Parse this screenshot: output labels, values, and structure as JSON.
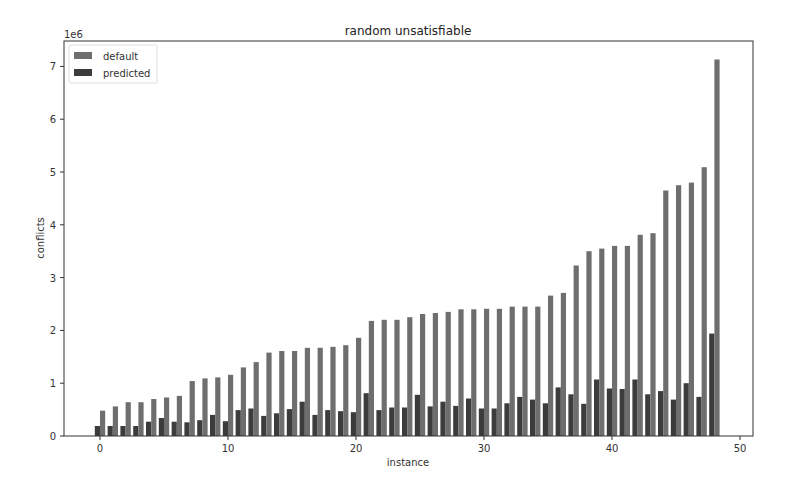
{
  "chart_data": {
    "type": "bar",
    "title": "random unsatisfiable",
    "xlabel": "instance",
    "ylabel": "conflicts",
    "y_offset_label": "1e6",
    "xlim": [
      -2,
      51
    ],
    "ylim": [
      0,
      7.5
    ],
    "xticks": [
      0,
      10,
      20,
      30,
      40,
      50
    ],
    "yticks": [
      0,
      1,
      2,
      3,
      4,
      5,
      6,
      7
    ],
    "grid": false,
    "legend_position": "upper left",
    "categories": [
      0,
      1,
      2,
      3,
      4,
      5,
      6,
      7,
      8,
      9,
      10,
      11,
      12,
      13,
      14,
      15,
      16,
      17,
      18,
      19,
      20,
      21,
      22,
      23,
      24,
      25,
      26,
      27,
      28,
      29,
      30,
      31,
      32,
      33,
      34,
      35,
      36,
      37,
      38,
      39,
      40,
      41,
      42,
      43,
      44,
      45,
      46,
      47,
      48
    ],
    "series": [
      {
        "name": "default",
        "color": "#6e6e6e",
        "values": [
          0.48,
          0.56,
          0.64,
          0.64,
          0.7,
          0.73,
          0.76,
          1.04,
          1.09,
          1.11,
          1.16,
          1.3,
          1.4,
          1.58,
          1.61,
          1.61,
          1.67,
          1.67,
          1.69,
          1.72,
          1.86,
          2.18,
          2.2,
          2.2,
          2.25,
          2.31,
          2.33,
          2.35,
          2.4,
          2.4,
          2.41,
          2.41,
          2.45,
          2.45,
          2.45,
          2.66,
          2.71,
          3.23,
          3.5,
          3.55,
          3.6,
          3.6,
          3.81,
          3.84,
          4.65,
          4.75,
          4.8,
          5.09,
          7.13
        ]
      },
      {
        "name": "predicted",
        "color": "#3c3c3c",
        "values": [
          0.19,
          0.19,
          0.19,
          0.19,
          0.27,
          0.34,
          0.27,
          0.26,
          0.3,
          0.4,
          0.28,
          0.49,
          0.52,
          0.38,
          0.43,
          0.51,
          0.65,
          0.4,
          0.49,
          0.47,
          0.45,
          0.81,
          0.49,
          0.54,
          0.54,
          0.78,
          0.56,
          0.65,
          0.57,
          0.71,
          0.52,
          0.52,
          0.62,
          0.74,
          0.69,
          0.62,
          0.92,
          0.79,
          0.61,
          1.07,
          0.9,
          0.89,
          1.07,
          0.79,
          0.85,
          0.69,
          1.0,
          0.74,
          1.94
        ]
      }
    ]
  }
}
